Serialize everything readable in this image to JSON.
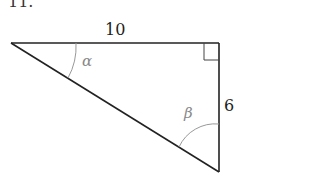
{
  "problem_number": "11.",
  "triangle": {
    "top_side_label": "10",
    "right_side_label": "6",
    "angle_alpha_label": "α",
    "angle_beta_label": "β",
    "right_angle_marker": true
  },
  "colors": {
    "line": "#222222",
    "angle_arc": "#999999"
  }
}
